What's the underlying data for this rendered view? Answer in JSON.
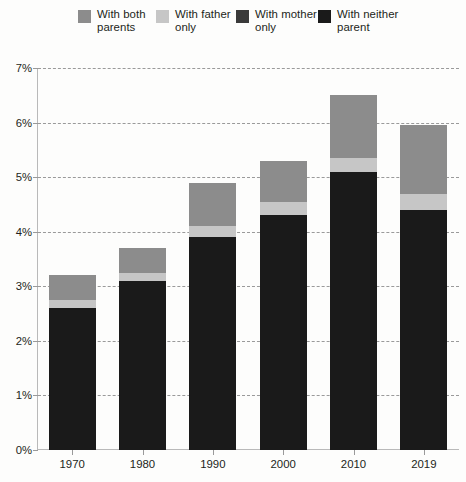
{
  "chart_data": {
    "type": "bar",
    "stacked": true,
    "title": "",
    "subtitle": "",
    "xlabel": "",
    "ylabel": "",
    "categories": [
      "1970",
      "1980",
      "1990",
      "2000",
      "2010",
      "2019"
    ],
    "ylim": [
      0,
      7
    ],
    "ytick_labels": [
      "0%",
      "1%",
      "2%",
      "3%",
      "4%",
      "5%",
      "6%",
      "7%"
    ],
    "ytick_values": [
      0,
      1,
      2,
      3,
      4,
      5,
      6,
      7
    ],
    "yunit": "%",
    "grid": true,
    "grid_style": "dashed-horizontal",
    "legend_position": "top",
    "series": [
      {
        "name": "With neither parent",
        "color": "#1a1a1a",
        "values": [
          2.6,
          3.1,
          3.9,
          4.3,
          5.1,
          4.4
        ]
      },
      {
        "name": "With mother only",
        "color": "#262626",
        "values": [
          0.0,
          0.0,
          0.0,
          0.0,
          0.0,
          0.0
        ]
      },
      {
        "name": "With father only",
        "color": "#c6c6c6",
        "values": [
          0.15,
          0.15,
          0.2,
          0.25,
          0.25,
          0.3
        ]
      },
      {
        "name": "With both parents",
        "color": "#8c8c8c",
        "values": [
          0.45,
          0.45,
          0.8,
          0.75,
          1.15,
          1.25
        ]
      }
    ],
    "totals": [
      3.2,
      3.7,
      4.9,
      5.3,
      6.5,
      6.0
    ]
  },
  "legend": {
    "items": [
      {
        "label": "With both\nparents",
        "color": "#8c8c8c",
        "swatch_name": "legend-swatch-both-parents"
      },
      {
        "label": "With father\nonly",
        "color": "#c6c6c6",
        "swatch_name": "legend-swatch-father-only"
      },
      {
        "label": "With mother\nonly",
        "color": "#3a3a3a",
        "swatch_name": "legend-swatch-mother-only"
      },
      {
        "label": "With neither\nparent",
        "color": "#1a1a1a",
        "swatch_name": "legend-swatch-neither-parent"
      }
    ]
  },
  "axes": {
    "y_labels": [
      "7%",
      "6%",
      "5%",
      "4%",
      "3%",
      "2%",
      "1%",
      "0%"
    ],
    "x_labels": [
      "1970",
      "1980",
      "1990",
      "2000",
      "2010",
      "2019"
    ]
  },
  "colors": {
    "background": "#fdfdfc",
    "axis": "#b9b9b9",
    "grid": "#9a9a9a",
    "text": "#231f20"
  }
}
